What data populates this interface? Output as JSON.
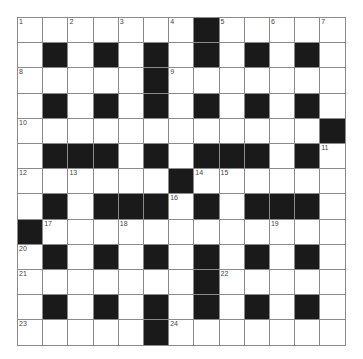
{
  "puzzle": {
    "rows": 13,
    "cols": 13,
    "colors": {
      "block": "#1a1a1a",
      "cell": "#ffffff",
      "line": "#8a8a8a",
      "number": "#444444"
    },
    "layout": [
      "WWWWWWWBWWWWW",
      "WBWBWBWBWBWBW",
      "WWWWWBWWWWWWW",
      "WBWBWBWBWBWBW",
      "WWWWWWWWWWWWB",
      "WBBBWBWBBBWBW",
      "WWWWWWBWWWWWW",
      "WBWBBBWBWBBBW",
      "BWWWWWWWWWWWW",
      "WBWBWBWBWBWBW",
      "WWWWWWWBWWWWW",
      "WBWBWBWBWBWBW",
      "WWWWWBWWWWWWW"
    ],
    "numbers": [
      {
        "r": 0,
        "c": 0,
        "n": "1"
      },
      {
        "r": 0,
        "c": 2,
        "n": "2"
      },
      {
        "r": 0,
        "c": 4,
        "n": "3"
      },
      {
        "r": 0,
        "c": 6,
        "n": "4"
      },
      {
        "r": 0,
        "c": 8,
        "n": "5"
      },
      {
        "r": 0,
        "c": 10,
        "n": "6"
      },
      {
        "r": 0,
        "c": 12,
        "n": "7"
      },
      {
        "r": 2,
        "c": 0,
        "n": "8"
      },
      {
        "r": 2,
        "c": 6,
        "n": "9"
      },
      {
        "r": 4,
        "c": 0,
        "n": "10"
      },
      {
        "r": 5,
        "c": 12,
        "n": "11"
      },
      {
        "r": 6,
        "c": 0,
        "n": "12"
      },
      {
        "r": 6,
        "c": 2,
        "n": "13"
      },
      {
        "r": 6,
        "c": 7,
        "n": "14"
      },
      {
        "r": 6,
        "c": 8,
        "n": "15"
      },
      {
        "r": 7,
        "c": 6,
        "n": "16"
      },
      {
        "r": 8,
        "c": 1,
        "n": "17"
      },
      {
        "r": 8,
        "c": 4,
        "n": "18"
      },
      {
        "r": 8,
        "c": 10,
        "n": "19"
      },
      {
        "r": 9,
        "c": 0,
        "n": "20"
      },
      {
        "r": 10,
        "c": 0,
        "n": "21"
      },
      {
        "r": 10,
        "c": 8,
        "n": "22"
      },
      {
        "r": 12,
        "c": 0,
        "n": "23"
      },
      {
        "r": 12,
        "c": 6,
        "n": "24"
      }
    ]
  }
}
